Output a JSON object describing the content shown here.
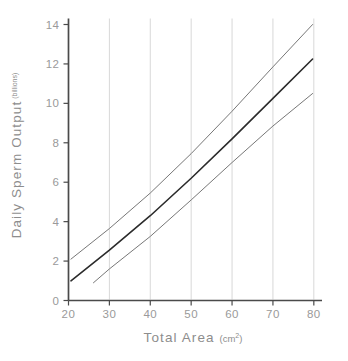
{
  "figure": {
    "background_color": "#ffffff",
    "axis_color": "#4a4a4a",
    "grid_color": "#d8d8d8",
    "tick_label_color": "#9a9a9a",
    "axis_title_color": "#8d8d8d"
  },
  "axes": {
    "y_title_main": "Daily Sperm Output",
    "y_title_unit": "(billions)",
    "x_title_main": "Total Area",
    "x_title_unit_prefix": "(cm",
    "x_title_unit_sup": "2",
    "x_title_unit_suffix": ")"
  },
  "chart_data": {
    "type": "line",
    "title": "",
    "subtitle": "",
    "xlabel": "Total Area (cm2)",
    "ylabel": "Daily Sperm Output (billions)",
    "xlim": [
      20,
      82
    ],
    "ylim": [
      0,
      14
    ],
    "x_ticks": [
      20,
      30,
      40,
      50,
      60,
      70,
      80
    ],
    "x_tick_labels": [
      "20",
      "30",
      "40",
      "50",
      "60",
      "70",
      "80"
    ],
    "y_ticks": [
      0,
      2,
      4,
      6,
      8,
      10,
      12,
      14
    ],
    "y_tick_labels": [
      "0",
      "2",
      "4",
      "6",
      "8",
      "10",
      "12",
      "14"
    ],
    "grid": {
      "vertical": true,
      "horizontal": false,
      "vertical_at": [
        30,
        40,
        50,
        60,
        70,
        80
      ]
    },
    "legend": {
      "visible": false,
      "position": "none"
    },
    "annotations": [],
    "series": [
      {
        "name": "upper confidence limit",
        "color": "#777777",
        "width": 1.0,
        "x": [
          20.6,
          30,
          40,
          50,
          60,
          70,
          79.7
        ],
        "values": [
          2.1,
          3.65,
          5.45,
          7.45,
          9.6,
          11.85,
          14.0
        ]
      },
      {
        "name": "regression line",
        "color": "#2b2b2b",
        "width": 1.6,
        "x": [
          20.6,
          30,
          40,
          50,
          60,
          70,
          79.7
        ],
        "values": [
          1.0,
          2.55,
          4.3,
          6.2,
          8.2,
          10.25,
          12.25
        ]
      },
      {
        "name": "lower confidence limit",
        "color": "#777777",
        "width": 1.0,
        "x": [
          26.1,
          30,
          40,
          50,
          60,
          70,
          79.7
        ],
        "values": [
          0.9,
          1.6,
          3.25,
          5.1,
          7.0,
          8.85,
          10.5
        ]
      }
    ]
  }
}
